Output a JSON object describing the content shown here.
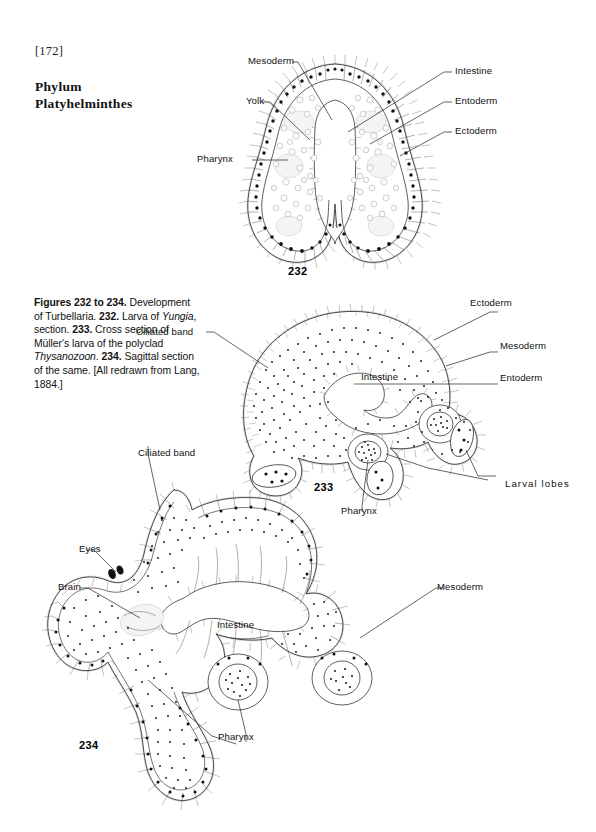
{
  "page": {
    "folio": "[172]",
    "heading_line1": "Phylum",
    "heading_line2": "Platyhelminthes",
    "background_color": "#ffffff",
    "ink_color": "#1a1a1a"
  },
  "caption": {
    "lead_bold": "Figures 232 to 234.",
    "text_1": " Development of Turbellaria. ",
    "num_232": "232.",
    "text_2": " Larva of ",
    "italic_yungia": "Yungia",
    "text_3": ", section. ",
    "num_233": "233.",
    "text_4": " Cross section of Müller's larva of the polyclad ",
    "italic_thysanozoon": "Thysanozoon",
    "text_5": ". ",
    "num_234": "234.",
    "text_6": " Sagittal section of the same. [All redrawn from Lang, 1884.]",
    "full_text": "Figures 232 to 234. Development of Turbellaria. 232. Larva of Yungia, section. 233. Cross section of Müller's larva of the polyclad Thysanozoon. 234. Sagittal section of the same. [All redrawn from Lang, 1884.]"
  },
  "figures": [
    {
      "number": "232",
      "title": "Larva of Yungia, section",
      "labels": [
        {
          "text": "Mesoderm",
          "side": "left"
        },
        {
          "text": "Yolk",
          "side": "left"
        },
        {
          "text": "Pharynx",
          "side": "left"
        },
        {
          "text": "Intestine",
          "side": "right"
        },
        {
          "text": "Entoderm",
          "side": "right"
        },
        {
          "text": "Ectoderm",
          "side": "right"
        }
      ]
    },
    {
      "number": "233",
      "title": "Cross section of Müller's larva of the polyclad Thysanozoon",
      "labels": [
        {
          "text": "Ciliated band",
          "side": "left"
        },
        {
          "text": "Intestine",
          "side": "center"
        },
        {
          "text": "Pharynx",
          "side": "bottom"
        },
        {
          "text": "Ectoderm",
          "side": "right"
        },
        {
          "text": "Mesoderm",
          "side": "right"
        },
        {
          "text": "Entoderm",
          "side": "right"
        },
        {
          "text": "Larval lobes",
          "side": "right"
        }
      ]
    },
    {
      "number": "234",
      "title": "Sagittal section of the same",
      "labels": [
        {
          "text": "Ciliated band",
          "side": "top"
        },
        {
          "text": "Eyes",
          "side": "left"
        },
        {
          "text": "Brain",
          "side": "left"
        },
        {
          "text": "Intestine",
          "side": "center"
        },
        {
          "text": "Pharynx",
          "side": "bottom"
        },
        {
          "text": "Mesoderm",
          "side": "right"
        }
      ]
    }
  ],
  "labels": {
    "f232_mesoderm": "Mesoderm",
    "f232_yolk": "Yolk",
    "f232_pharynx": "Pharynx",
    "f232_intestine": "Intestine",
    "f232_entoderm": "Entoderm",
    "f232_ectoderm": "Ectoderm",
    "f232_num": "232",
    "f233_ciliated_band": "Ciliated band",
    "f233_intestine": "Intestine",
    "f233_pharynx": "Pharynx",
    "f233_ectoderm": "Ectoderm",
    "f233_mesoderm": "Mesoderm",
    "f233_entoderm": "Entoderm",
    "f233_larval_lobes": "Larval lobes",
    "f233_num": "233",
    "f234_ciliated_band": "Ciliated band",
    "f234_eyes": "Eyes",
    "f234_brain": "Brain",
    "f234_intestine": "Intestine",
    "f234_pharynx": "Pharynx",
    "f234_mesoderm": "Mesoderm",
    "f234_num": "234"
  }
}
